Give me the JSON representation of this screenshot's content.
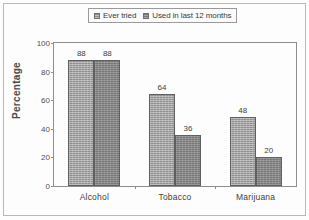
{
  "chart_data": {
    "type": "bar",
    "title": "",
    "xlabel": "",
    "ylabel": "Percentage",
    "ylim": [
      0,
      100
    ],
    "yticks": [
      0,
      20,
      40,
      60,
      80,
      100
    ],
    "grid": false,
    "legend_position": "top",
    "categories": [
      "Alcohol",
      "Tobacco",
      "Marijuana"
    ],
    "series": [
      {
        "name": "Ever tried",
        "values": [
          88,
          64,
          48
        ],
        "color": "#8f8f8f"
      },
      {
        "name": "Used in last 12 months",
        "values": [
          88,
          36,
          20
        ],
        "color": "#767676"
      }
    ]
  },
  "legend": {
    "entries": [
      {
        "label": "Ever tried",
        "swatch": "legend-swatch-ever-tried"
      },
      {
        "label": "Used in last 12 months",
        "swatch": "legend-swatch-last-12-months"
      }
    ]
  },
  "axes": {
    "y_title": "Percentage",
    "y_ticks": [
      "100",
      "80",
      "60",
      "40",
      "20",
      "0"
    ],
    "x_categories": [
      "Alcohol",
      "Tobacco",
      "Marijuana"
    ]
  },
  "bar_values": {
    "alcohol": [
      "88",
      "88"
    ],
    "tobacco": [
      "64",
      "36"
    ],
    "marijuana": [
      "48",
      "20"
    ]
  }
}
